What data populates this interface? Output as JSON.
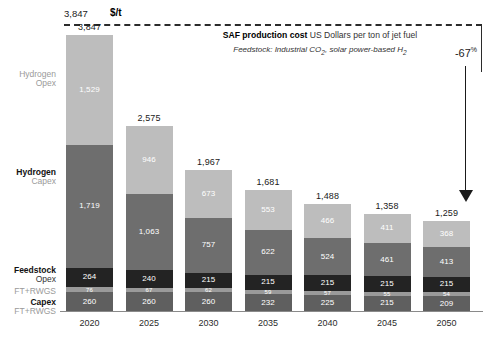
{
  "header": {
    "top_value": "3,847",
    "unit": "$/t",
    "title_bold": "SAF production cost",
    "title_rest": " US Dollars per ton of jet fuel",
    "subtitle_pre": "Feedstock: Industrial CO",
    "subtitle_sub1": "2",
    "subtitle_mid": ", solar power-based H",
    "subtitle_sub2": "2",
    "reduction_label": "-67",
    "reduction_unit": "%"
  },
  "row_labels": {
    "hydrogen_opex_l1": "Hydrogen",
    "hydrogen_opex_l2": "Opex",
    "hydrogen_capex_l1": "Hydrogen",
    "hydrogen_capex_l2": "Capex",
    "feedstock_l1": "Feedstock",
    "feedstock_l2": "Opex",
    "ft_opex": "FT+RWGS",
    "ft_capex_l1": "Capex",
    "ft_capex_l2": "FT+RWGS"
  },
  "chart_data": {
    "type": "bar",
    "stacked": true,
    "title": "SAF production cost US Dollars per ton of jet fuel",
    "subtitle": "Feedstock: Industrial CO2, solar power-based H2",
    "xlabel": "",
    "ylabel": "US Dollars per ton of jet fuel",
    "unit": "$/t",
    "ylim": [
      0,
      3847
    ],
    "grid": false,
    "legend_position": "left-axis-labels",
    "categories": [
      "2020",
      "2025",
      "2030",
      "2035",
      "2040",
      "2045",
      "2050"
    ],
    "totals": [
      3847,
      2575,
      1967,
      1681,
      1488,
      1358,
      1259
    ],
    "totals_display": [
      "3,847",
      "2,575",
      "1,967",
      "1,681",
      "1,488",
      "1,358",
      "1,259"
    ],
    "series": [
      {
        "name": "Capex FT+RWGS",
        "color": "#5f5f5f",
        "values": [
          260,
          260,
          260,
          232,
          225,
          215,
          209
        ],
        "labels": [
          "260",
          "260",
          "260",
          "232",
          "225",
          "215",
          "209"
        ]
      },
      {
        "name": "Opex FT+RWGS",
        "color": "#9a9a9a",
        "values": [
          76,
          67,
          62,
          59,
          57,
          55,
          54
        ],
        "labels": [
          "76",
          "67",
          "62",
          "59",
          "57",
          "55",
          "54"
        ]
      },
      {
        "name": "Feedstock Opex",
        "color": "#232323",
        "values": [
          264,
          240,
          215,
          215,
          215,
          215,
          215
        ],
        "labels": [
          "264",
          "240",
          "215",
          "215",
          "215",
          "215",
          "215"
        ]
      },
      {
        "name": "Hydrogen Capex",
        "color": "#6e6e6e",
        "values": [
          1719,
          1063,
          757,
          622,
          524,
          461,
          413
        ],
        "labels": [
          "1,719",
          "1,063",
          "757",
          "622",
          "524",
          "461",
          "413"
        ]
      },
      {
        "name": "Hydrogen Opex",
        "color": "#bdbdbd",
        "values": [
          1529,
          946,
          673,
          553,
          466,
          411,
          368
        ],
        "labels": [
          "1,529",
          "946",
          "673",
          "553",
          "466",
          "411",
          "368"
        ]
      }
    ],
    "annotations": [
      {
        "text": "-67%",
        "type": "reduction-arrow",
        "from": 3847,
        "to": 1259
      }
    ]
  }
}
